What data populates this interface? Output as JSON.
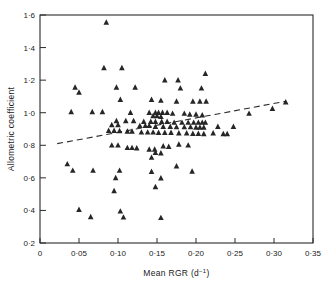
{
  "chart_data": {
    "type": "scatter",
    "title": "",
    "xlabel": "Mean RGR (d⁻¹)",
    "ylabel": "Allometric coefficient",
    "xlim": [
      0,
      0.35
    ],
    "ylim": [
      0.2,
      1.6
    ],
    "xticks": [
      0,
      0.05,
      0.1,
      0.15,
      0.2,
      0.25,
      0.3,
      0.35
    ],
    "xtick_labels": [
      "0",
      "0·05",
      "0·10",
      "0·15",
      "0·20",
      "0·25",
      "0·30",
      "0·35"
    ],
    "yticks": [
      0.2,
      0.4,
      0.6,
      0.8,
      1.0,
      1.2,
      1.4,
      1.6
    ],
    "ytick_labels": [
      "0·2",
      "0·4",
      "0·6",
      "0·8",
      "1·0",
      "1·2",
      "1·4",
      "1·6"
    ],
    "grid": false,
    "legend": null,
    "marker": "triangle",
    "marker_color": "#262626",
    "series": [
      {
        "name": "Allometric coefficient vs mean RGR",
        "points": [
          [
            0.085,
            1.555
          ],
          [
            0.082,
            1.275
          ],
          [
            0.105,
            1.275
          ],
          [
            0.045,
            1.155
          ],
          [
            0.05,
            1.125
          ],
          [
            0.098,
            1.155
          ],
          [
            0.122,
            1.155
          ],
          [
            0.16,
            1.2
          ],
          [
            0.177,
            1.2
          ],
          [
            0.212,
            1.24
          ],
          [
            0.18,
            1.15
          ],
          [
            0.207,
            1.15
          ],
          [
            0.04,
            1.005
          ],
          [
            0.067,
            1.005
          ],
          [
            0.08,
            1.005
          ],
          [
            0.103,
            1.08
          ],
          [
            0.143,
            1.08
          ],
          [
            0.155,
            1.075
          ],
          [
            0.175,
            1.07
          ],
          [
            0.196,
            1.07
          ],
          [
            0.205,
            1.07
          ],
          [
            0.213,
            1.07
          ],
          [
            0.116,
            1.0
          ],
          [
            0.14,
            1.0
          ],
          [
            0.148,
            1.0
          ],
          [
            0.152,
            1.0
          ],
          [
            0.157,
            1.0
          ],
          [
            0.163,
            1.0
          ],
          [
            0.17,
            0.995
          ],
          [
            0.185,
            0.995
          ],
          [
            0.192,
            0.99
          ],
          [
            0.2,
            0.99
          ],
          [
            0.208,
            0.985
          ],
          [
            0.145,
            0.98
          ],
          [
            0.15,
            0.98
          ],
          [
            0.155,
            0.975
          ],
          [
            0.098,
            0.95
          ],
          [
            0.11,
            0.95
          ],
          [
            0.12,
            0.95
          ],
          [
            0.133,
            0.945
          ],
          [
            0.142,
            0.945
          ],
          [
            0.148,
            0.945
          ],
          [
            0.156,
            0.945
          ],
          [
            0.163,
            0.945
          ],
          [
            0.172,
            0.94
          ],
          [
            0.182,
            0.94
          ],
          [
            0.19,
            0.94
          ],
          [
            0.197,
            0.94
          ],
          [
            0.203,
            0.94
          ],
          [
            0.208,
            0.94
          ],
          [
            0.212,
            0.94
          ],
          [
            0.092,
            0.925
          ],
          [
            0.1,
            0.925
          ],
          [
            0.128,
            0.92
          ],
          [
            0.135,
            0.92
          ],
          [
            0.14,
            0.92
          ],
          [
            0.148,
            0.915
          ],
          [
            0.158,
            0.915
          ],
          [
            0.167,
            0.915
          ],
          [
            0.175,
            0.912
          ],
          [
            0.185,
            0.912
          ],
          [
            0.193,
            0.912
          ],
          [
            0.2,
            0.91
          ],
          [
            0.205,
            0.91
          ],
          [
            0.21,
            0.91
          ],
          [
            0.088,
            0.89
          ],
          [
            0.095,
            0.89
          ],
          [
            0.102,
            0.888
          ],
          [
            0.112,
            0.885
          ],
          [
            0.118,
            0.885
          ],
          [
            0.13,
            0.88
          ],
          [
            0.138,
            0.88
          ],
          [
            0.145,
            0.88
          ],
          [
            0.152,
            0.878
          ],
          [
            0.16,
            0.878
          ],
          [
            0.168,
            0.878
          ],
          [
            0.178,
            0.875
          ],
          [
            0.188,
            0.875
          ],
          [
            0.196,
            0.872
          ],
          [
            0.203,
            0.872
          ],
          [
            0.21,
            0.87
          ],
          [
            0.228,
            0.915
          ],
          [
            0.248,
            0.915
          ],
          [
            0.222,
            0.875
          ],
          [
            0.235,
            0.87
          ],
          [
            0.24,
            0.87
          ],
          [
            0.268,
            0.995
          ],
          [
            0.298,
            1.025
          ],
          [
            0.315,
            1.065
          ],
          [
            0.092,
            0.8
          ],
          [
            0.1,
            0.8
          ],
          [
            0.112,
            0.785
          ],
          [
            0.118,
            0.785
          ],
          [
            0.124,
            0.782
          ],
          [
            0.14,
            0.775
          ],
          [
            0.147,
            0.775
          ],
          [
            0.158,
            0.795
          ],
          [
            0.165,
            0.792
          ],
          [
            0.178,
            0.805
          ],
          [
            0.19,
            0.8
          ],
          [
            0.148,
            0.755
          ],
          [
            0.155,
            0.752
          ],
          [
            0.143,
            0.725
          ],
          [
            0.175,
            0.672
          ],
          [
            0.143,
            0.638
          ],
          [
            0.195,
            0.64
          ],
          [
            0.035,
            0.685
          ],
          [
            0.042,
            0.645
          ],
          [
            0.068,
            0.645
          ],
          [
            0.102,
            0.645
          ],
          [
            0.097,
            0.6
          ],
          [
            0.155,
            0.598
          ],
          [
            0.095,
            0.52
          ],
          [
            0.148,
            0.545
          ],
          [
            0.05,
            0.405
          ],
          [
            0.065,
            0.36
          ],
          [
            0.103,
            0.395
          ],
          [
            0.107,
            0.358
          ],
          [
            0.155,
            0.355
          ]
        ]
      }
    ],
    "trendline": {
      "style": "dashed",
      "x_start": 0.022,
      "y_start": 0.81,
      "x_end": 0.315,
      "y_end": 1.07
    }
  }
}
